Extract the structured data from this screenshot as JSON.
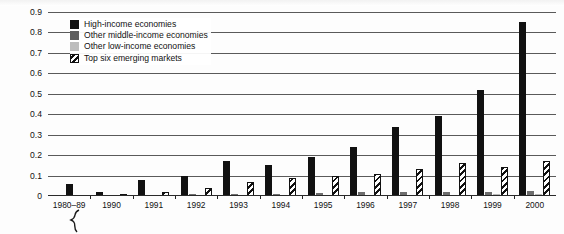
{
  "chart_data": {
    "type": "bar",
    "title": "",
    "subtitle": "",
    "xlabel": "",
    "ylabel": "",
    "ylim": [
      0,
      0.9
    ],
    "ytick_step": 0.1,
    "yticks": [
      "0.9",
      "0.8",
      "0.7",
      "0.6",
      "0.5",
      "0.4",
      "0.3",
      "0.2",
      "0.1",
      "0"
    ],
    "grid": true,
    "grid_axis": "y",
    "legend_position": "top-left-inside",
    "axis_break": true,
    "axis_break_note": "zigzag break on x-axis between 1980-89 and 1990",
    "categories": [
      "1980–89",
      "1990",
      "1991",
      "1992",
      "1993",
      "1994",
      "1995",
      "1996",
      "1997",
      "1998",
      "1999",
      "2000"
    ],
    "series": [
      {
        "name": "High-income economies",
        "key": "s-high",
        "color": "#111111",
        "pattern": "solid",
        "values": [
          0.06,
          0.08,
          0.1,
          0.17,
          0.15,
          0.19,
          0.24,
          0.34,
          0.39,
          0.52,
          0.85,
          0.0
        ]
      },
      {
        "name": "Other middle-income economies",
        "key": "s-mid",
        "color": "#6e6e6e",
        "pattern": "solid",
        "values": [
          0.0,
          0.005,
          0.005,
          0.01,
          0.01,
          0.012,
          0.015,
          0.018,
          0.02,
          0.02,
          0.022,
          0.025
        ]
      },
      {
        "name": "Other low-income economies",
        "key": "s-low",
        "color": "#b9b9b9",
        "pattern": "solid",
        "values": [
          0.0,
          0.003,
          0.003,
          0.004,
          0.005,
          0.005,
          0.006,
          0.006,
          0.007,
          0.007,
          0.008,
          0.008
        ]
      },
      {
        "name": "Top six emerging markets",
        "key": "s-top",
        "color": "#111111",
        "pattern": "diagonal-hatch",
        "values": [
          0.0,
          0.01,
          0.02,
          0.04,
          0.07,
          0.09,
          0.1,
          0.11,
          0.13,
          0.16,
          0.14,
          0.17
        ]
      }
    ],
    "series_order_note": "Within each year group bars are drawn left to right: high-income, other middle-income, other low-income, top six emerging markets",
    "value_corrections": {
      "note": "series values are aligned so index 0 = 1980-89 ... index 11 = 2000",
      "s-high": [
        0.06,
        0.02,
        0.08,
        0.1,
        0.17,
        0.15,
        0.19,
        0.24,
        0.34,
        0.39,
        0.52,
        0.85
      ]
    }
  },
  "legend": {
    "items": [
      {
        "label": "High-income economies",
        "key": "s-high"
      },
      {
        "label": "Other middle-income economies",
        "key": "s-mid"
      },
      {
        "label": "Other low-income economies",
        "key": "s-low"
      },
      {
        "label": "Top six emerging markets",
        "key": "s-top"
      }
    ]
  }
}
